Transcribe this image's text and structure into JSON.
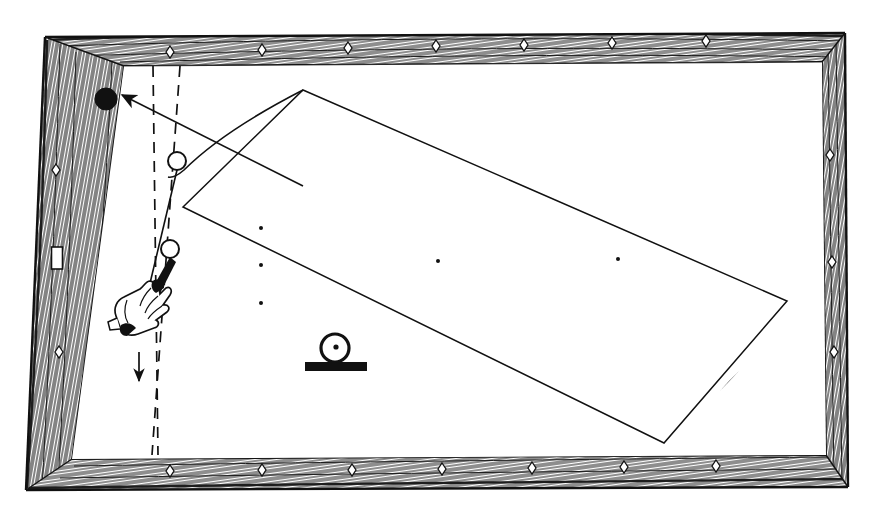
{
  "figure": {
    "title": "Billiard table diagram",
    "style": "black ink line drawing on white, wood-grain hatched rails",
    "ink_color": "#111111",
    "paper_color": "#ffffff"
  },
  "table": {
    "name": "billiard-table",
    "cloth_color": "#ffffff",
    "rail_color": "#ffffff",
    "rail_hatch_color": "#111111",
    "outer_frame": {
      "top_left": [
        45,
        37
      ],
      "top_right": [
        845,
        33
      ],
      "bottom_right": [
        848,
        487
      ],
      "bottom_left": [
        26,
        490
      ]
    },
    "cloth_bed": {
      "top_left": [
        124,
        66
      ],
      "top_right": [
        822,
        62
      ],
      "bottom_right": [
        826,
        455
      ],
      "bottom_left": [
        72,
        459
      ]
    },
    "rails": [
      {
        "name": "top-rail",
        "marker_count": 6
      },
      {
        "name": "right-rail",
        "marker_count": 3
      },
      {
        "name": "bottom-rail",
        "marker_count": 6
      },
      {
        "name": "left-rail",
        "marker_count": 2
      }
    ],
    "sight_markers": {
      "shape": "diamond",
      "top": [
        {
          "x": 170,
          "y": 52
        },
        {
          "x": 262,
          "y": 50
        },
        {
          "x": 348,
          "y": 48
        },
        {
          "x": 436,
          "y": 46
        },
        {
          "x": 524,
          "y": 45
        },
        {
          "x": 612,
          "y": 43
        },
        {
          "x": 706,
          "y": 41
        }
      ],
      "right": [
        {
          "x": 826,
          "y": 155
        },
        {
          "x": 829,
          "y": 262
        },
        {
          "x": 831,
          "y": 352
        }
      ],
      "bottom": [
        {
          "x": 170,
          "y": 471
        },
        {
          "x": 262,
          "y": 470
        },
        {
          "x": 352,
          "y": 470
        },
        {
          "x": 442,
          "y": 469
        },
        {
          "x": 532,
          "y": 468
        },
        {
          "x": 624,
          "y": 467
        },
        {
          "x": 716,
          "y": 466
        }
      ],
      "left": [
        {
          "x": 55,
          "y": 170
        },
        {
          "x": 58,
          "y": 352
        }
      ]
    },
    "left_rail_plate": {
      "x": 57,
      "y": 258,
      "w": 11,
      "h": 22,
      "name": "rail-plate"
    }
  },
  "balls": [
    {
      "name": "object-ball",
      "fill": "solid",
      "cx": 106,
      "cy": 99,
      "r": 11
    },
    {
      "name": "cue-ball-upper",
      "cx": 177,
      "cy": 161,
      "r": 9
    },
    {
      "name": "cue-ball-lower",
      "cx": 170,
      "cy": 249,
      "r": 9
    }
  ],
  "spot_marks": {
    "left_column": [
      {
        "x": 261,
        "y": 228
      },
      {
        "x": 261,
        "y": 265
      },
      {
        "x": 261,
        "y": 303
      }
    ],
    "center_row": [
      {
        "x": 438,
        "y": 261
      },
      {
        "x": 618,
        "y": 259
      }
    ]
  },
  "aiming_lines": {
    "name": "aiming-lines",
    "style": "dashed",
    "line_a": {
      "x1": 153,
      "y1": 66,
      "x2": 158,
      "y2": 455
    },
    "line_b": {
      "x1": 180,
      "y1": 66,
      "x2": 152,
      "y2": 455
    },
    "arrow": {
      "x": 138,
      "y": 385,
      "direction": "down"
    }
  },
  "shot_arrow": {
    "name": "object-ball-path-arrow",
    "from": [
      303,
      186
    ],
    "to": [
      116,
      92
    ],
    "direction": "up-left"
  },
  "swept_path": {
    "name": "swept-path-quadrilateral",
    "vertices": [
      [
        303,
        90
      ],
      [
        787,
        301
      ],
      [
        664,
        443
      ],
      [
        183,
        207
      ]
    ],
    "arrow": {
      "x": 727,
      "y": 383,
      "direction": "down-left"
    }
  },
  "curve": {
    "name": "ball-deflection-curve",
    "start": [
      303,
      90
    ],
    "end": [
      168,
      177
    ],
    "control": [
      205,
      120
    ]
  },
  "cue": {
    "name": "cue-stick",
    "tip": [
      176,
      170
    ],
    "butt": [
      131,
      318
    ],
    "hand_center": [
      146,
      305
    ],
    "hand_label": "bridge-hand"
  },
  "roller": {
    "name": "ball-on-rail-symbol",
    "circle": {
      "cx": 335,
      "cy": 348,
      "r": 14
    },
    "center_dot_r": 2.5,
    "bar": {
      "x": 305,
      "y": 362,
      "w": 62,
      "h": 9
    }
  }
}
